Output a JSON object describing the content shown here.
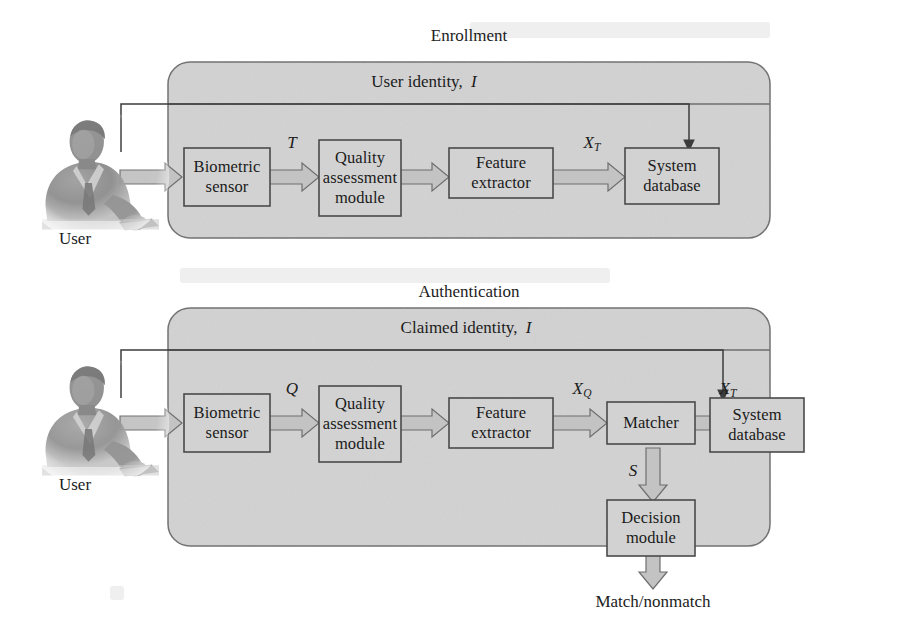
{
  "figure": {
    "background_color": "#ffffff",
    "panel_fill": "#d2d2d2",
    "panel_stroke": "#6e6e6e",
    "box_fill": "#d2d2d2",
    "box_stroke": "#4a4a4a",
    "arrow_fill": "#c0c0c0",
    "arrow_stroke": "#6a6a6a",
    "text_color": "#1c1c1c"
  },
  "enrollment": {
    "title": "Enrollment",
    "inner_title": "User identity, I",
    "inner_title_text": "User identity,",
    "inner_title_symbol": "I",
    "user_caption": "User",
    "user_icon": "person-at-desk-icon",
    "boxes": [
      {
        "id": "biometric-sensor",
        "label": "Biometric sensor",
        "lines": [
          "Biometric",
          "sensor"
        ]
      },
      {
        "id": "quality-assessment-module",
        "label": "Quality assessment module",
        "lines": [
          "Quality",
          "assessment",
          "module"
        ]
      },
      {
        "id": "feature-extractor",
        "label": "Feature extractor",
        "lines": [
          "Feature",
          "extractor"
        ]
      },
      {
        "id": "system-database",
        "label": "System database",
        "lines": [
          "System",
          "database"
        ]
      }
    ],
    "signals": [
      {
        "id": "signal-T",
        "symbol": "T",
        "subscript": "",
        "between": [
          "biometric-sensor",
          "quality-assessment-module"
        ]
      },
      {
        "id": "signal-XT",
        "symbol": "X",
        "subscript": "T",
        "between": [
          "feature-extractor",
          "system-database"
        ]
      }
    ]
  },
  "authentication": {
    "title": "Authentication",
    "inner_title": "Claimed identity, I",
    "inner_title_text": "Claimed identity,",
    "inner_title_symbol": "I",
    "user_caption": "User",
    "user_icon": "person-at-desk-icon",
    "boxes": [
      {
        "id": "biometric-sensor",
        "label": "Biometric sensor",
        "lines": [
          "Biometric",
          "sensor"
        ]
      },
      {
        "id": "quality-assessment-module",
        "label": "Quality assessment module",
        "lines": [
          "Quality",
          "assessment",
          "module"
        ]
      },
      {
        "id": "feature-extractor",
        "label": "Feature extractor",
        "lines": [
          "Feature",
          "extractor"
        ]
      },
      {
        "id": "matcher",
        "label": "Matcher",
        "lines": [
          "Matcher"
        ]
      },
      {
        "id": "system-database",
        "label": "System database",
        "lines": [
          "System",
          "database"
        ]
      },
      {
        "id": "decision-module",
        "label": "Decision module",
        "lines": [
          "Decision",
          "module"
        ]
      }
    ],
    "signals": [
      {
        "id": "signal-Q",
        "symbol": "Q",
        "subscript": "",
        "between": [
          "biometric-sensor",
          "quality-assessment-module"
        ]
      },
      {
        "id": "signal-XQ",
        "symbol": "X",
        "subscript": "Q",
        "between": [
          "feature-extractor",
          "matcher"
        ]
      },
      {
        "id": "signal-XT",
        "symbol": "X",
        "subscript": "T",
        "between": [
          "system-database",
          "matcher"
        ]
      },
      {
        "id": "signal-S",
        "symbol": "S",
        "subscript": "",
        "between": [
          "matcher",
          "decision-module"
        ]
      }
    ],
    "output_label": "Match/nonmatch"
  }
}
